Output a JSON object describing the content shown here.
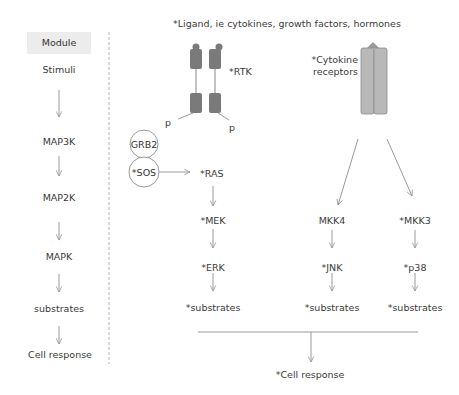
{
  "left_panel": {
    "header": "Module",
    "steps": [
      "Stimuli",
      "MAP3K",
      "MAP2K",
      "MAPK",
      "substrates",
      "Cell response"
    ]
  },
  "right_panel": {
    "ligand_note": "*Ligand, ie cytokines, growth factors, hormones",
    "rtk_label": "*RTK",
    "phospho_left": "p",
    "phospho_right": "p",
    "adaptor_top": "GRB2",
    "adaptor_bottom": "*SOS",
    "cytokine_label_line1": "*Cytokine",
    "cytokine_label_line2": "receptors",
    "erk_pathway": [
      "*RAS",
      "*MEK",
      "*ERK",
      "*substrates"
    ],
    "jnk_pathway": [
      "MKK4",
      "*JNK",
      "*substrates"
    ],
    "p38_pathway": [
      "*MKK3",
      "*p38",
      "*substrates"
    ],
    "final_output": "*Cell response"
  },
  "colors": {
    "arrow": "#9a9a9a",
    "receptor_dark": "#7a7a7a",
    "receptor_light": "#b8b8b8",
    "module_bg": "#ececec",
    "text": "#3a3a3a"
  }
}
